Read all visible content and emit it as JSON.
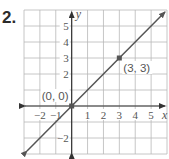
{
  "problem_number": "2.",
  "graph": {
    "x_range": [
      -3,
      6
    ],
    "y_range": [
      -3,
      6
    ],
    "x_axis_label": "x",
    "y_axis_label": "y",
    "x_ticks": [
      "−2",
      "−1",
      "1",
      "2",
      "3",
      "4",
      "5"
    ],
    "x_tick_values": [
      -2,
      -1,
      1,
      2,
      3,
      4,
      5
    ],
    "y_ticks": [
      "5",
      "4",
      "3",
      "2",
      "−2"
    ],
    "y_tick_values": [
      5,
      4,
      3,
      2,
      -2
    ],
    "points": [
      {
        "label": "(0, 0)",
        "x": 0,
        "y": 0
      },
      {
        "label": "(3, 3)",
        "x": 3,
        "y": 3
      }
    ],
    "line": {
      "equation": "y = x",
      "slope": 1,
      "intercept": 0
    },
    "colors": {
      "grid": "#b8b8b8",
      "axis": "#333333",
      "line": "#555555",
      "text": "#555555"
    }
  },
  "chart_data": {
    "type": "line",
    "title": "",
    "xlabel": "x",
    "ylabel": "y",
    "xlim": [
      -3,
      6
    ],
    "ylim": [
      -3,
      6
    ],
    "grid": true,
    "series": [
      {
        "name": "y = x",
        "x": [
          -3,
          6
        ],
        "y": [
          -3,
          6
        ]
      }
    ],
    "annotations": [
      {
        "text": "(0, 0)",
        "x": 0,
        "y": 0
      },
      {
        "text": "(3, 3)",
        "x": 3,
        "y": 3
      }
    ]
  }
}
